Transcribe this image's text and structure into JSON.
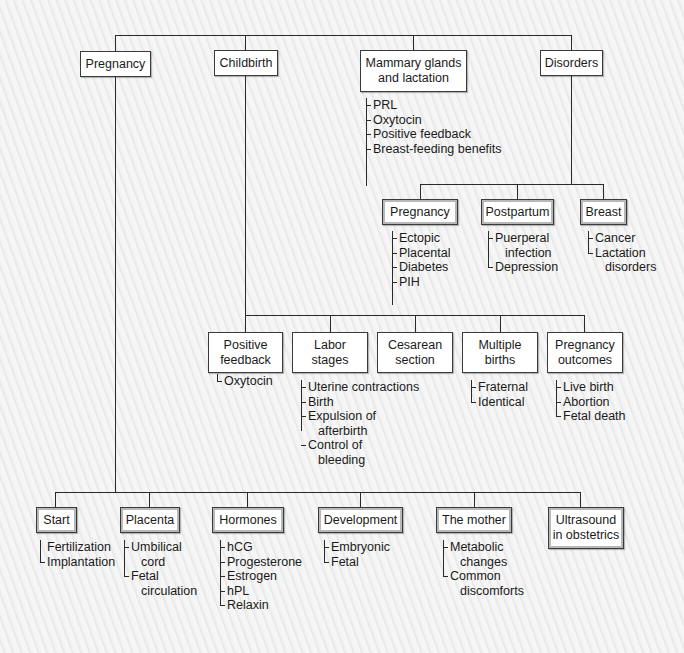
{
  "diagram": {
    "top": {
      "pregnancy": "Pregnancy",
      "childbirth": "Childbirth",
      "mammary": "Mammary glands\nand lactation",
      "disorders": "Disorders"
    },
    "mammary_items": [
      "PRL",
      "Oxytocin",
      "Positive feedback",
      "Breast-feeding benefits"
    ],
    "disorders": {
      "pregnancy": {
        "label": "Pregnancy",
        "items": [
          "Ectopic",
          "Placental",
          "Diabetes",
          "PIH"
        ]
      },
      "postpartum": {
        "label": "Postpartum",
        "items": [
          "Puerperal",
          "infection",
          "Depression"
        ]
      },
      "breast": {
        "label": "Breast",
        "items": [
          "Cancer",
          "Lactation",
          "disorders"
        ]
      }
    },
    "childbirth": {
      "positive_feedback": {
        "label": "Positive\nfeedback",
        "items": [
          "Oxytocin"
        ]
      },
      "labor_stages": {
        "label": "Labor\nstages",
        "items": [
          "Uterine contractions",
          "Birth",
          "Expulsion of",
          "afterbirth",
          "Control of",
          "bleeding"
        ]
      },
      "cesarean": {
        "label": "Cesarean\nsection"
      },
      "multiple_births": {
        "label": "Multiple\nbirths",
        "items": [
          "Fraternal",
          "Identical"
        ]
      },
      "outcomes": {
        "label": "Pregnancy\noutcomes",
        "items": [
          "Live birth",
          "Abortion",
          "Fetal death"
        ]
      }
    },
    "pregnancy": {
      "start": {
        "label": "Start",
        "items": [
          "Fertilization",
          "Implantation"
        ]
      },
      "placenta": {
        "label": "Placenta",
        "items": [
          "Umbilical",
          "cord",
          "Fetal",
          "circulation"
        ]
      },
      "hormones": {
        "label": "Hormones",
        "items": [
          "hCG",
          "Progesterone",
          "Estrogen",
          "hPL",
          "Relaxin"
        ]
      },
      "development": {
        "label": "Development",
        "items": [
          "Embryonic",
          "Fetal"
        ]
      },
      "mother": {
        "label": "The mother",
        "items": [
          "Metabolic",
          "changes",
          "Common",
          "discomforts"
        ]
      },
      "ultrasound": {
        "label": "Ultrasound\nin obstetrics"
      }
    }
  }
}
